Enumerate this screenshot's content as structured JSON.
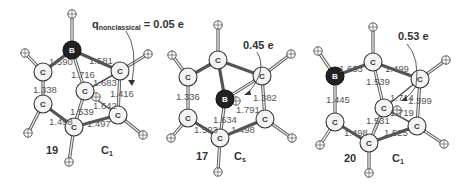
{
  "figure": {
    "molecules": [
      {
        "id": "19",
        "label": "19",
        "symmetry": "C",
        "symmetry_sub": "1",
        "charge_annotation": {
          "prefix": "q",
          "subscript": "nonclassical",
          "text": " = 0.05 e"
        },
        "bond_lengths": {
          "b_cleft": "1.590",
          "b_cright": "1.581",
          "b_ccenter": "1.716",
          "ccenter_cright": "1.683",
          "cright_crb": "1.416",
          "ccenter_crb": "1.642",
          "cleft_clb": "1.338",
          "ccenter_cbottom": "1.539",
          "clb_cbottom": "1.498",
          "cbottom_crb": "1.497"
        }
      },
      {
        "id": "17",
        "label": "17",
        "symmetry": "C",
        "symmetry_sub": "s",
        "charge_annotation": {
          "text": "0.45 e"
        },
        "bond_lengths": {
          "cleft_clb": "1.336",
          "cright_crb": "1.382",
          "b_cright": "1.791",
          "b_cbottom": "1.634",
          "clb_cbottom": "1.503",
          "cbottom_crb": "1.498"
        }
      },
      {
        "id": "20",
        "label": "20",
        "symmetry": "C",
        "symmetry_sub": "1",
        "charge_annotation": {
          "text": "0.53 e"
        },
        "bond_lengths": {
          "b_ctop": "1.633",
          "ctop_cright": "1.499",
          "ctop_ccenter": "1.539",
          "ccenter_cright": "1.714",
          "cright_crb": "1.399",
          "ccenter_crb": "1.719",
          "b_cleft": "1.445",
          "ccenter_cbottom": "1.531",
          "cleft_cbottom": "1.498",
          "cbottom_crb": "1.525"
        }
      }
    ],
    "atom_labels": {
      "carbon": "C",
      "boron": "B"
    }
  }
}
